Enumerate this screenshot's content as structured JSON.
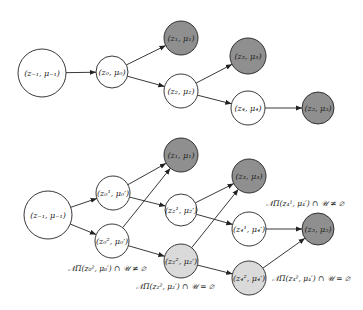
{
  "colors": {
    "white": "#ffffff",
    "dark": "#8f8f8f",
    "light": "#dadada",
    "stroke": "#222222"
  },
  "top_graph": {
    "nodes": [
      {
        "id": "t_zm1",
        "label": "(z₋₁, μ₋₁)",
        "cx": 42,
        "cy": 73,
        "r": 24,
        "fill": "white"
      },
      {
        "id": "t_z0",
        "label": "(z₀, μ₀)",
        "cx": 112,
        "cy": 72,
        "r": 16,
        "fill": "white"
      },
      {
        "id": "t_z1",
        "label": "(z₁, μ₁)",
        "cx": 181,
        "cy": 38,
        "r": 17,
        "fill": "dark"
      },
      {
        "id": "t_z2",
        "label": "(z₂, μ₂)",
        "cx": 181,
        "cy": 91,
        "r": 17,
        "fill": "white"
      },
      {
        "id": "t_z3",
        "label": "(z₃, μ₃)",
        "cx": 248,
        "cy": 56,
        "r": 18,
        "fill": "dark"
      },
      {
        "id": "t_z4",
        "label": "(z₄, μ₄)",
        "cx": 248,
        "cy": 108,
        "r": 17,
        "fill": "white"
      },
      {
        "id": "t_z5",
        "label": "(z₅, μ₅)",
        "cx": 318,
        "cy": 108,
        "r": 16,
        "fill": "dark"
      }
    ],
    "edges": [
      [
        "t_zm1",
        "t_z0"
      ],
      [
        "t_z0",
        "t_z1"
      ],
      [
        "t_z0",
        "t_z2"
      ],
      [
        "t_z2",
        "t_z3"
      ],
      [
        "t_z2",
        "t_z4"
      ],
      [
        "t_z4",
        "t_z5"
      ]
    ]
  },
  "bottom_graph": {
    "nodes": [
      {
        "id": "b_zm1",
        "label": "(z₋₁, μ₋₁)",
        "cx": 48,
        "cy": 215,
        "r": 24,
        "fill": "white"
      },
      {
        "id": "b_z01",
        "label": "(z₀¹, μ₀′)",
        "cx": 113,
        "cy": 193,
        "r": 17,
        "fill": "white"
      },
      {
        "id": "b_z02",
        "label": "(z₀², μ₀′)",
        "cx": 112,
        "cy": 241,
        "r": 17,
        "fill": "white"
      },
      {
        "id": "b_z1",
        "label": "(z₁, μ₁)",
        "cx": 181,
        "cy": 155,
        "r": 17,
        "fill": "dark"
      },
      {
        "id": "b_z21",
        "label": "(z₂¹, μ₂′)",
        "cx": 181,
        "cy": 210,
        "r": 16,
        "fill": "white"
      },
      {
        "id": "b_z22",
        "label": "(z₂², μ₂′)",
        "cx": 181,
        "cy": 261,
        "r": 17,
        "fill": "light"
      },
      {
        "id": "b_z3",
        "label": "(z₃, μ₃)",
        "cx": 249,
        "cy": 176,
        "r": 17,
        "fill": "dark"
      },
      {
        "id": "b_z41",
        "label": "(z₄¹, μ₄′)",
        "cx": 249,
        "cy": 229,
        "r": 17,
        "fill": "white"
      },
      {
        "id": "b_z42",
        "label": "(z₄², μ₄′)",
        "cx": 249,
        "cy": 278,
        "r": 17,
        "fill": "light"
      },
      {
        "id": "b_z5",
        "label": "(z₅, μ₅)",
        "cx": 318,
        "cy": 229,
        "r": 16,
        "fill": "dark"
      }
    ],
    "edges": [
      [
        "b_zm1",
        "b_z01"
      ],
      [
        "b_zm1",
        "b_z02"
      ],
      [
        "b_z01",
        "b_z1"
      ],
      [
        "b_z01",
        "b_z21"
      ],
      [
        "b_z02",
        "b_z1"
      ],
      [
        "b_z02",
        "b_z22"
      ],
      [
        "b_z21",
        "b_z3"
      ],
      [
        "b_z21",
        "b_z41"
      ],
      [
        "b_z22",
        "b_z3"
      ],
      [
        "b_z22",
        "b_z42"
      ],
      [
        "b_z41",
        "b_z5"
      ],
      [
        "b_z42",
        "b_z5"
      ]
    ],
    "conditions": [
      {
        "id": "cond_z02",
        "text": "𝒩Π(z₀², μ₀′) ∩ 𝒰 ≠ ∅",
        "x": 68,
        "y": 271
      },
      {
        "id": "cond_z22",
        "text": "𝒩Π(z₂², μ₂′) ∩ 𝒰 = ∅",
        "x": 136,
        "y": 289
      },
      {
        "id": "cond_z41",
        "text": "𝒩Π(z₄¹, μ₄′) ∩ 𝒰 ≠ ∅",
        "x": 266,
        "y": 206
      },
      {
        "id": "cond_z42",
        "text": "𝒩Π(z₄², μ₄′) ∩ 𝒰 = ∅",
        "x": 272,
        "y": 281
      }
    ]
  }
}
